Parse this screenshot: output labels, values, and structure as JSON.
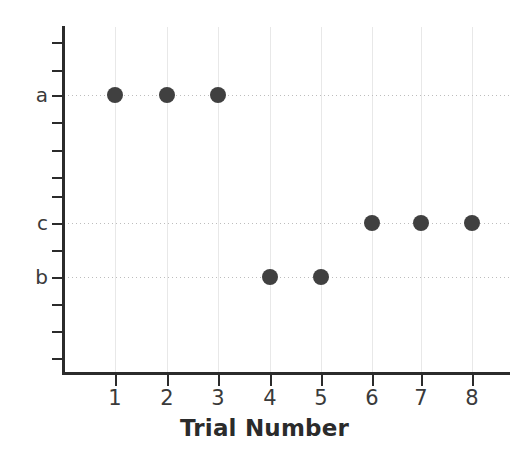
{
  "chart_data": {
    "type": "scatter",
    "title": "",
    "subtitle": "",
    "xlabel": "Trial Number",
    "ylabel": "",
    "x": [
      1,
      2,
      3,
      4,
      5,
      6,
      7,
      8
    ],
    "y": [
      "a",
      "a",
      "a",
      "b",
      "b",
      "c",
      "c",
      "c"
    ],
    "points": [
      {
        "x": 1,
        "y": "a"
      },
      {
        "x": 2,
        "y": "a"
      },
      {
        "x": 3,
        "y": "a"
      },
      {
        "x": 4,
        "y": "b"
      },
      {
        "x": 5,
        "y": "b"
      },
      {
        "x": 6,
        "y": "c"
      },
      {
        "x": 7,
        "y": "c"
      },
      {
        "x": 8,
        "y": "c"
      }
    ],
    "series": [
      {
        "name": "",
        "x": [
          1,
          2,
          3,
          4,
          5,
          6,
          7,
          8
        ],
        "values": [
          "a",
          "a",
          "a",
          "b",
          "b",
          "c",
          "c",
          "c"
        ]
      }
    ],
    "x_tick_labels": [
      "1",
      "2",
      "3",
      "4",
      "5",
      "6",
      "7",
      "8"
    ],
    "y_tick_labels": [
      "a",
      "c",
      "b"
    ],
    "y_categories_plotted": [
      "a",
      "c",
      "b"
    ],
    "xlim": [
      0.4,
      8.6
    ],
    "grid": true,
    "grid_axes": "both",
    "legend": "none",
    "marker": "circle",
    "marker_color": "#404040",
    "marker_size_px": 16,
    "hgrid_color": "#bdbdbd",
    "vgrid_color": "#e8e8e8",
    "axis_color": "#2b2b2b",
    "background_color": "#ffffff"
  },
  "axes": {
    "y_labels": [
      {
        "text": "a",
        "top_px": 95
      },
      {
        "text": "c",
        "top_px": 223
      },
      {
        "text": "b",
        "top_px": 277
      }
    ],
    "y_tick_tops_px": [
      42,
      70,
      95,
      122,
      150,
      177,
      196,
      223,
      250,
      277,
      304,
      331,
      358
    ],
    "x_labels": [
      {
        "text": "1",
        "left_px": 115
      },
      {
        "text": "2",
        "left_px": 167
      },
      {
        "text": "3",
        "left_px": 218
      },
      {
        "text": "4",
        "left_px": 270
      },
      {
        "text": "5",
        "left_px": 321
      },
      {
        "text": "6",
        "left_px": 372
      },
      {
        "text": "7",
        "left_px": 421
      },
      {
        "text": "8",
        "left_px": 472
      }
    ],
    "x_title": "Trial Number"
  },
  "render": {
    "vgrid_left_px": [
      51,
      103,
      154,
      206,
      257,
      308,
      357,
      408
    ],
    "hgrid_top_px": [
      68,
      196,
      250
    ],
    "markers": [
      {
        "left_px": 51,
        "top_px": 68,
        "label": "trial-1-a"
      },
      {
        "left_px": 103,
        "top_px": 68,
        "label": "trial-2-a"
      },
      {
        "left_px": 154,
        "top_px": 68,
        "label": "trial-3-a"
      },
      {
        "left_px": 206,
        "top_px": 250,
        "label": "trial-4-b"
      },
      {
        "left_px": 257,
        "top_px": 250,
        "label": "trial-5-b"
      },
      {
        "left_px": 308,
        "top_px": 196,
        "label": "trial-6-c"
      },
      {
        "left_px": 357,
        "top_px": 196,
        "label": "trial-7-c"
      },
      {
        "left_px": 408,
        "top_px": 196,
        "label": "trial-8-c"
      }
    ]
  }
}
